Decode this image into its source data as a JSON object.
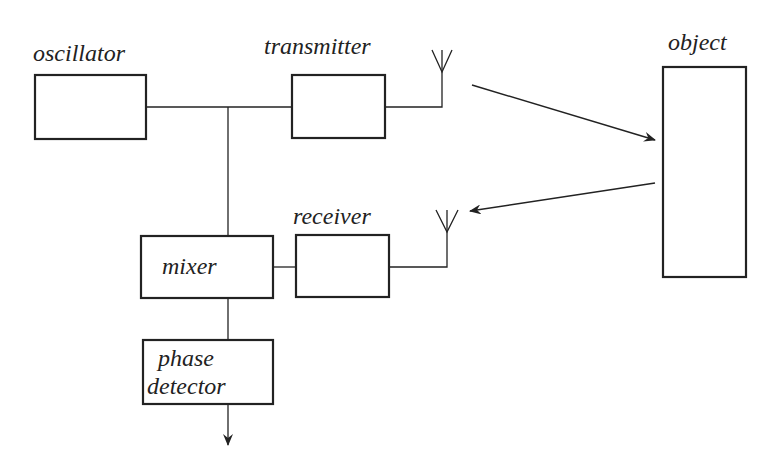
{
  "diagram": {
    "type": "block-diagram",
    "blocks": {
      "oscillator": {
        "label": "oscillator"
      },
      "transmitter": {
        "label": "transmitter"
      },
      "object": {
        "label": "object"
      },
      "receiver": {
        "label": "receiver"
      },
      "mixer": {
        "label": "mixer"
      },
      "phase_detector": {
        "label_line1": "phase",
        "label_line2": "detector"
      }
    },
    "connections": [
      {
        "from": "oscillator",
        "to": "transmitter"
      },
      {
        "from": "oscillator",
        "to": "mixer"
      },
      {
        "from": "transmitter",
        "to": "transmit-antenna"
      },
      {
        "from": "transmit-antenna",
        "to": "object",
        "kind": "arrow"
      },
      {
        "from": "object",
        "to": "receive-antenna",
        "kind": "arrow"
      },
      {
        "from": "receive-antenna",
        "to": "receiver"
      },
      {
        "from": "receiver",
        "to": "mixer"
      },
      {
        "from": "mixer",
        "to": "phase_detector"
      },
      {
        "from": "phase_detector",
        "to": "output",
        "kind": "arrow"
      }
    ],
    "colors": {
      "stroke": "#222222",
      "background": "#ffffff"
    }
  }
}
